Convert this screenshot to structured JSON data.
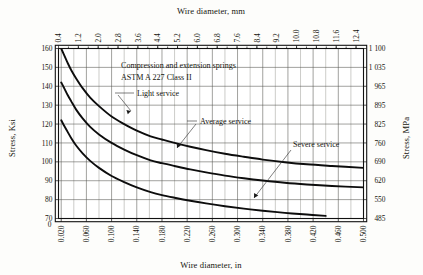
{
  "figure": {
    "background": "#fdfdfb",
    "ink": "#0d0d0d"
  },
  "annotations": {
    "title_line1": "Compression and extension springs",
    "title_line2": "ASTM A 227 Class II",
    "light": "Light service",
    "average": "Average service",
    "severe": "Severe service"
  },
  "axes": {
    "top": {
      "label": "Wire diameter, mm",
      "ticks": [
        "0.4",
        "1.2",
        "2.0",
        "2.8",
        "3.6",
        "4.4",
        "5.2",
        "6.0",
        "6.8",
        "7.6",
        "8.4",
        "9.2",
        "10.0",
        "10.8",
        "11.6",
        "12.4"
      ],
      "min": 0.4,
      "max": 12.7
    },
    "bottom": {
      "label": "Wire diameter, in",
      "zero": "0",
      "ticks": [
        "0.020",
        "0.060",
        "0.100",
        "0.140",
        "0.180",
        "0.220",
        "0.260",
        "0.300",
        "0.340",
        "0.380",
        "0.420",
        "0.460",
        "0.500"
      ],
      "min": 0.0157,
      "max": 0.5
    },
    "left": {
      "label": "Stress, Ksi",
      "ticks": [
        "160",
        "150",
        "140",
        "130",
        "120",
        "110",
        "100",
        "90",
        "80",
        "70"
      ],
      "min": 70,
      "max": 160
    },
    "right": {
      "label": "Stress, MPa",
      "ticks": [
        "1 100",
        "1 035",
        "965",
        "895",
        "825",
        "760",
        "690",
        "620",
        "550",
        "485"
      ],
      "min": 485,
      "max": 1100
    }
  },
  "chart_data": {
    "type": "line",
    "xlabel": "Wire diameter, in",
    "ylabel": "Stress, Ksi",
    "xlabel_secondary": "Wire diameter, mm",
    "ylabel_secondary": "Stress, MPa",
    "xlim": [
      0.0157,
      0.5
    ],
    "ylim": [
      70,
      160
    ],
    "grid": true,
    "legend": "inline-annotations",
    "series": [
      {
        "name": "Light service",
        "x": [
          0.02,
          0.024,
          0.03,
          0.036,
          0.044,
          0.054,
          0.066,
          0.08,
          0.1,
          0.12,
          0.14,
          0.162,
          0.18,
          0.2,
          0.225,
          0.25,
          0.28,
          0.31,
          0.34,
          0.375,
          0.41,
          0.45,
          0.5
        ],
        "values": [
          160.0,
          157.0,
          152.5,
          148.5,
          144.0,
          139.0,
          134.0,
          129.5,
          124.0,
          120.0,
          116.5,
          113.5,
          111.8,
          110.0,
          108.0,
          106.2,
          104.3,
          102.7,
          101.2,
          99.8,
          98.7,
          97.8,
          96.8
        ]
      },
      {
        "name": "Average service",
        "x": [
          0.02,
          0.024,
          0.03,
          0.036,
          0.044,
          0.054,
          0.066,
          0.08,
          0.1,
          0.12,
          0.14,
          0.162,
          0.18,
          0.2,
          0.225,
          0.25,
          0.28,
          0.31,
          0.34,
          0.375,
          0.41,
          0.45,
          0.5
        ],
        "values": [
          142.0,
          139.5,
          135.5,
          132.0,
          127.5,
          123.0,
          118.5,
          114.5,
          110.0,
          106.5,
          103.5,
          100.8,
          99.3,
          97.8,
          96.0,
          94.4,
          92.7,
          91.3,
          90.1,
          88.9,
          88.0,
          87.2,
          86.5
        ]
      },
      {
        "name": "Severe service",
        "x": [
          0.02,
          0.024,
          0.03,
          0.036,
          0.044,
          0.054,
          0.066,
          0.08,
          0.1,
          0.12,
          0.14,
          0.162,
          0.18,
          0.2,
          0.225,
          0.25,
          0.28,
          0.31,
          0.34,
          0.375,
          0.41,
          0.44
        ],
        "values": [
          122.0,
          119.5,
          116.0,
          112.5,
          108.5,
          104.5,
          100.5,
          96.8,
          92.5,
          89.3,
          86.5,
          84.0,
          82.4,
          81.0,
          79.4,
          78.0,
          76.5,
          75.2,
          74.1,
          73.0,
          72.1,
          71.4
        ]
      }
    ]
  }
}
